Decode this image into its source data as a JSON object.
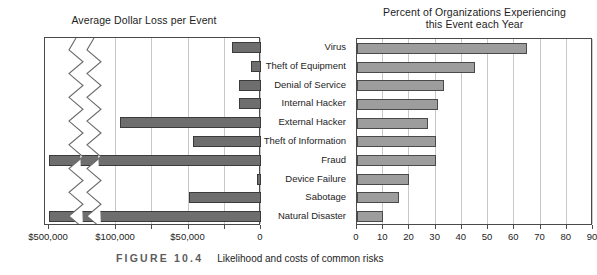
{
  "figure": {
    "number_label": "FIGURE 10.4",
    "caption": "Likelihood and costs of common risks"
  },
  "categories": [
    "Virus",
    "Theft of Equipment",
    "Denial of Service",
    "Internal Hacker",
    "External Hacker",
    "Theft of Information",
    "Fraud",
    "Device Failure",
    "Sabotage",
    "Natural Disaster"
  ],
  "left_chart": {
    "title": "Average Dollar Loss per Event",
    "tick_labels": [
      "$500,000",
      "$100,000",
      "$50,000",
      "0"
    ],
    "axis_note": "axis reversed, zero at right, broken scale between $100,000 and $500,000"
  },
  "right_chart": {
    "title_line1": "Percent of Organizations Experiencing",
    "title_line2": "this Event each Year",
    "tick_labels": [
      "0",
      "10",
      "20",
      "30",
      "40",
      "50",
      "60",
      "70",
      "80",
      "90"
    ]
  },
  "chart_data": [
    {
      "type": "bar",
      "orientation": "horizontal",
      "title": "Average Dollar Loss per Event",
      "xlabel": "",
      "ylabel": "",
      "categories": [
        "Virus",
        "Theft of Equipment",
        "Denial of Service",
        "Internal Hacker",
        "External Hacker",
        "Theft of Information",
        "Fraud",
        "Device Failure",
        "Sabotage",
        "Natural Disaster"
      ],
      "values": [
        20000,
        7000,
        15000,
        15000,
        97000,
        47000,
        520000,
        2500,
        50000,
        520000
      ],
      "xlim": [
        0,
        500000
      ],
      "xticks": [
        0,
        50000,
        100000,
        500000
      ],
      "xtick_labels": [
        "0",
        "$50,000",
        "$100,000",
        "$500,000"
      ],
      "reversed_x_axis": true,
      "broken_axis": true,
      "grid": true,
      "legend": "none"
    },
    {
      "type": "bar",
      "orientation": "horizontal",
      "title": "Percent of Organizations Experiencing this Event each Year",
      "xlabel": "",
      "ylabel": "",
      "categories": [
        "Virus",
        "Theft of Equipment",
        "Denial of Service",
        "Internal Hacker",
        "External Hacker",
        "Theft of Information",
        "Fraud",
        "Device Failure",
        "Sabotage",
        "Natural Disaster"
      ],
      "values": [
        65,
        45,
        33,
        31,
        27,
        30,
        30,
        20,
        16,
        10
      ],
      "xlim": [
        0,
        90
      ],
      "xticks": [
        0,
        10,
        20,
        30,
        40,
        50,
        60,
        70,
        80,
        90
      ],
      "xtick_labels": [
        "0",
        "10",
        "20",
        "30",
        "40",
        "50",
        "60",
        "70",
        "80",
        "90"
      ],
      "grid": true,
      "legend": "none"
    }
  ],
  "colors": {
    "left_bar_fill": "#6e6e6e",
    "right_bar_fill": "#9d9d9d",
    "frame": "#4a4a4a",
    "gridline": "#c9c9c9"
  }
}
